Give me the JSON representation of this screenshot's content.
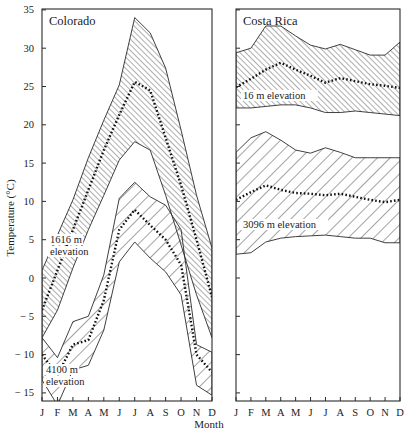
{
  "chart_data": [
    {
      "type": "area",
      "title": "Colorado",
      "xlabel": "Month",
      "ylabel": "Temperature (°C)",
      "ylim": [
        -16,
        35
      ],
      "yticks": [
        35,
        30,
        25,
        20,
        15,
        10,
        5,
        0,
        -5,
        -10,
        -15
      ],
      "categories": [
        "J",
        "F",
        "M",
        "A",
        "M",
        "J",
        "J",
        "A",
        "S",
        "O",
        "N",
        "D"
      ],
      "grid": false,
      "series": [
        {
          "name": "1616 m elevation",
          "label_lines": [
            "1616 m",
            "elevation"
          ],
          "hatch": "fine",
          "max": [
            1,
            5.6,
            10.2,
            15.7,
            20.6,
            25.2,
            34,
            32,
            27.4,
            19.3,
            10.8,
            3.9
          ],
          "mean": [
            -4.2,
            1,
            6.3,
            11.5,
            16.7,
            21.3,
            25.6,
            24.5,
            18.3,
            12.1,
            5,
            -2.5
          ],
          "min": [
            -7.8,
            -4.2,
            1.3,
            6.3,
            10.8,
            15.4,
            17.8,
            16.7,
            10.8,
            4.3,
            -2.2,
            -7.8
          ]
        },
        {
          "name": "4100 m elevation",
          "label_lines": [
            "4100 m",
            "elevation"
          ],
          "hatch": "coarse",
          "max": [
            -7.8,
            -10.4,
            -5.7,
            -5,
            0.4,
            10.4,
            12.5,
            10.6,
            9.5,
            6.3,
            -8.7,
            -9.7
          ],
          "mean": [
            -10,
            -12.7,
            -8.7,
            -8.1,
            -2.9,
            6.3,
            8.9,
            6.9,
            5,
            1.7,
            -10,
            -12.3
          ],
          "min": [
            -13.3,
            -16.6,
            -12,
            -11.4,
            -6.8,
            2.1,
            4.7,
            2.6,
            0.8,
            -2.2,
            -14,
            -15.3
          ]
        }
      ]
    },
    {
      "type": "area",
      "title": "Costa Rica",
      "xlabel": "Month",
      "ylabel": "Temperature (°C)",
      "ylim": [
        -16,
        35
      ],
      "categories": [
        "J",
        "F",
        "M",
        "A",
        "M",
        "J",
        "J",
        "A",
        "S",
        "O",
        "N",
        "D"
      ],
      "grid": false,
      "series": [
        {
          "name": "16 m elevation",
          "label_lines": [
            "16 m elevation"
          ],
          "hatch": "fine",
          "max": [
            29.4,
            30,
            32.9,
            32.9,
            31.6,
            30.4,
            29.9,
            30.5,
            29.8,
            29.1,
            29.1,
            30.8
          ],
          "mean": [
            24.9,
            26,
            27.2,
            28.1,
            27.2,
            26.4,
            25.5,
            26.1,
            25.7,
            25.3,
            25.1,
            24.8
          ],
          "min": [
            22.2,
            22.2,
            22.4,
            22.6,
            22.6,
            22.2,
            21.6,
            21.6,
            21.8,
            21.6,
            21.4,
            21.2
          ]
        },
        {
          "name": "3096 m elevation",
          "label_lines": [
            "3096 m elevation"
          ],
          "hatch": "coarse",
          "max": [
            16.4,
            18.3,
            19.1,
            18,
            16.7,
            16.3,
            17,
            16.4,
            15.7,
            15.7,
            15.7,
            15.7
          ],
          "mean": [
            10.2,
            11.2,
            12.1,
            11.5,
            11.1,
            11,
            10.8,
            11,
            10.6,
            10.2,
            9.9,
            10.2
          ],
          "min": [
            3.1,
            3.3,
            4.7,
            5.2,
            5.4,
            5.5,
            5.6,
            5.4,
            5.2,
            5.2,
            4.6,
            4.6
          ]
        }
      ]
    }
  ],
  "axis": {
    "ylabel": "Temperature (°C)",
    "xlabel": "Month"
  },
  "colors": {
    "line": "#2a2a2a",
    "background": "#ffffff"
  }
}
